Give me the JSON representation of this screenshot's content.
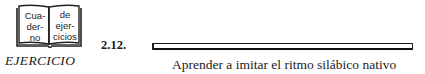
{
  "icon": {
    "name": "book-icon",
    "left_page": [
      "Cua-",
      "der-",
      "no"
    ],
    "right_page": [
      "de",
      "ejer-",
      "cicios"
    ]
  },
  "exercise": {
    "label": "EJERCICIO",
    "number": "2.12.",
    "title": "Aprender a imitar el ritmo silábico nativo"
  },
  "colors": {
    "text": "#1a1a1a",
    "background": "#ffffff"
  }
}
